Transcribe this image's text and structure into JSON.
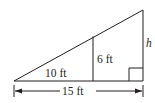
{
  "diagram": {
    "type": "similar-triangles",
    "labels": {
      "inner_base": "10 ft",
      "inner_height": "6 ft",
      "outer_height": "h",
      "outer_base": "15 ft"
    },
    "colors": {
      "line": "#231f20",
      "background": "#ffffff"
    },
    "right_angle_marker": true
  }
}
